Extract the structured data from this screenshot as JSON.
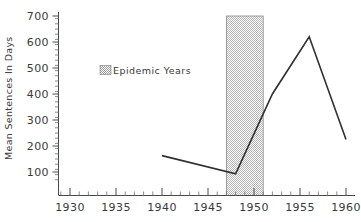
{
  "chart_data": {
    "type": "line",
    "title": "",
    "xlabel": "",
    "ylabel": "Mean Sentences In Days",
    "xlim": [
      1928,
      1961
    ],
    "ylim": [
      60,
      700
    ],
    "yticks": [
      100,
      200,
      300,
      400,
      500,
      600,
      700
    ],
    "xticks": [
      1930,
      1935,
      1940,
      1945,
      1950,
      1955,
      1960
    ],
    "xtick_labels": [
      "1930",
      "1935",
      "1940",
      "1945",
      "1950",
      "1955",
      "1960"
    ],
    "ytick_labels": [
      "100",
      "200",
      "300",
      "400",
      "500",
      "600",
      "700"
    ],
    "x_minor_step": 1,
    "grid": false,
    "legend_position": "upper-left-inside",
    "series": [
      {
        "name": "Mean Sentences In Days",
        "x": [
          1940,
          1948,
          1952,
          1956,
          1960
        ],
        "values": [
          163,
          93,
          400,
          620,
          225
        ]
      }
    ],
    "bands": [
      {
        "label": "Epidemic Years",
        "x_start": 1947,
        "x_end": 1951,
        "fill": "#d6d6d6",
        "edge": "#8a8a8a",
        "hatch": "checker"
      }
    ],
    "legend": [
      {
        "label": "Epidemic Years",
        "swatch": "hatched-gray"
      }
    ]
  },
  "axes": {
    "y_axis_label": "Mean Sentences In Days",
    "y_axis_name": "y-axis",
    "x_axis_name": "x-axis"
  },
  "colors": {
    "line": "#2f2f2f",
    "axis": "#4a4a4a",
    "band_fill": "#d6d6d6",
    "band_edge": "#8a8a8a",
    "background": "#ffffff",
    "text": "#3a3a3a"
  },
  "legend_entry_label": "Epidemic Years"
}
